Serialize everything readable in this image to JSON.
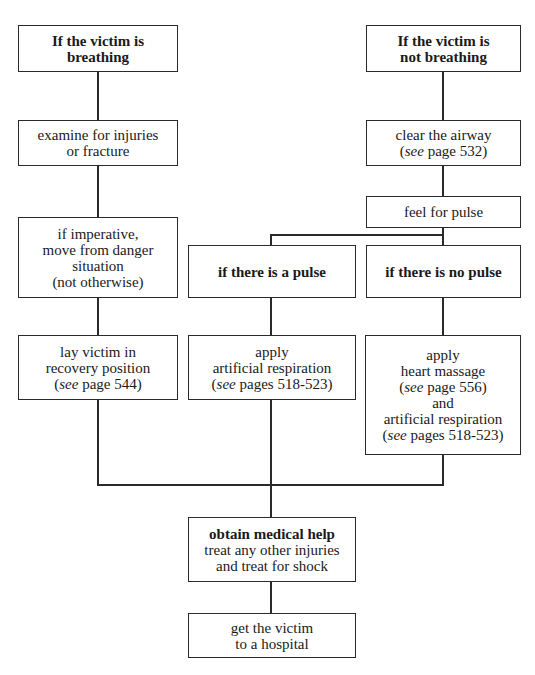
{
  "diagram": {
    "type": "flowchart",
    "nodes": {
      "breathing": {
        "lines": [
          "If the victim is",
          "breathing"
        ],
        "bold": true
      },
      "not_breathing": {
        "lines": [
          "If the victim is",
          "not breathing"
        ],
        "bold": true
      },
      "examine": {
        "lines": [
          "examine for injuries",
          "or fracture"
        ]
      },
      "clear_airway": {
        "line1": "clear the airway",
        "see": "see",
        "ref": " page 532)"
      },
      "feel_pulse": {
        "lines": [
          "feel for pulse"
        ]
      },
      "imperative": {
        "lines": [
          "if imperative,",
          "move from danger",
          "situation",
          "(not otherwise)"
        ]
      },
      "pulse": {
        "lines": [
          "if there is a pulse"
        ],
        "bold": true
      },
      "no_pulse": {
        "lines": [
          "if there is no pulse"
        ],
        "bold": true
      },
      "recovery": {
        "line1": "lay victim in",
        "line2": "recovery position",
        "see": "see",
        "ref": " page 544)"
      },
      "respiration": {
        "line1": "apply",
        "line2": "artificial respiration",
        "see": "see",
        "ref": " pages 518-523)"
      },
      "massage": {
        "line1": "apply",
        "line2": "heart massage",
        "see1": "see",
        "ref1": " page 556)",
        "line3": "and",
        "line4": "artificial respiration",
        "see2": "see",
        "ref2": " pages 518-523)"
      },
      "medical": {
        "title": "obtain medical help",
        "line2": "treat any other injuries",
        "line3": "and treat for shock"
      },
      "hospital": {
        "lines": [
          "get the victim",
          "to a hospital"
        ]
      }
    },
    "edges": [
      [
        "breathing",
        "examine"
      ],
      [
        "examine",
        "imperative"
      ],
      [
        "imperative",
        "recovery"
      ],
      [
        "not_breathing",
        "clear_airway"
      ],
      [
        "clear_airway",
        "feel_pulse"
      ],
      [
        "feel_pulse",
        "pulse"
      ],
      [
        "feel_pulse",
        "no_pulse"
      ],
      [
        "pulse",
        "respiration"
      ],
      [
        "no_pulse",
        "massage"
      ],
      [
        "recovery",
        "medical"
      ],
      [
        "respiration",
        "medical"
      ],
      [
        "massage",
        "medical"
      ],
      [
        "medical",
        "hospital"
      ]
    ]
  }
}
